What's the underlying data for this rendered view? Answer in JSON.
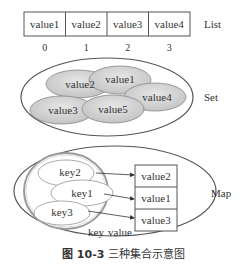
{
  "list": {
    "cells": [
      "value1",
      "value2",
      "value3",
      "value4"
    ],
    "indices": [
      "0",
      "1",
      "2",
      "3"
    ],
    "label": "List"
  },
  "set": {
    "elements": [
      "value2",
      "value1",
      "value4",
      "value3",
      "value5"
    ],
    "label": "Set"
  },
  "map": {
    "keys": [
      "key2",
      "key1",
      "key3"
    ],
    "values": [
      "value2",
      "value1",
      "value3"
    ],
    "key_label": "key",
    "value_label": "value",
    "label": "Map"
  },
  "caption": {
    "number": "图 10-3",
    "text": "三种集合示意图"
  }
}
